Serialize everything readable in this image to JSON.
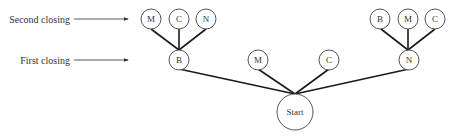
{
  "labels": {
    "second_closing": "Second closing",
    "first_closing": "First closing"
  },
  "nodes": {
    "start": "Start",
    "first_B": "B",
    "first_M": "M",
    "first_C": "C",
    "first_N": "N",
    "B_second_M": "M",
    "B_second_C": "C",
    "B_second_N": "N",
    "N_second_B": "B",
    "N_second_M": "M",
    "N_second_C": "C"
  }
}
